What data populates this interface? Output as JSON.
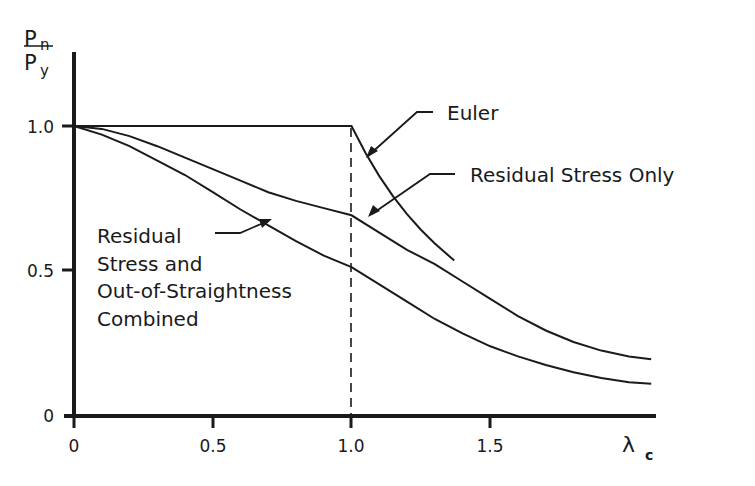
{
  "chart_data": {
    "type": "line",
    "title": "",
    "xlabel": "λ c",
    "xlabel_main": "λ",
    "xlabel_sub": "c",
    "ylabel": "Pn/Py",
    "ylabel_num_main": "P",
    "ylabel_num_sub": "n",
    "ylabel_den_main": "P",
    "ylabel_den_sub": "y",
    "xlim": [
      0,
      2.1
    ],
    "ylim": [
      0,
      1.15
    ],
    "grid": false,
    "x_ticks": [
      "0",
      "0.5",
      "1.0",
      "1.5"
    ],
    "x_tick_values": [
      0,
      0.5,
      1.0,
      1.5
    ],
    "y_ticks": [
      "0",
      "0.5",
      "1.0"
    ],
    "y_tick_values": [
      0,
      0.5,
      1.0
    ],
    "reference_line": {
      "x": 1.0,
      "style": "dashed",
      "from": 0,
      "to": 1.0
    },
    "series": [
      {
        "name": "Euler",
        "label": "Euler",
        "points": [
          [
            0,
            1.0
          ],
          [
            1.0,
            1.0
          ],
          [
            1.05,
            0.907
          ],
          [
            1.1,
            0.826
          ],
          [
            1.15,
            0.756
          ],
          [
            1.2,
            0.694
          ],
          [
            1.25,
            0.64
          ],
          [
            1.3,
            0.592
          ],
          [
            1.37,
            0.533
          ]
        ]
      },
      {
        "name": "Residual Stress Only",
        "label": "Residual Stress Only",
        "points": [
          [
            0,
            1.0
          ],
          [
            0.1,
            0.99
          ],
          [
            0.2,
            0.965
          ],
          [
            0.3,
            0.93
          ],
          [
            0.4,
            0.89
          ],
          [
            0.5,
            0.85
          ],
          [
            0.6,
            0.81
          ],
          [
            0.7,
            0.77
          ],
          [
            0.8,
            0.74
          ],
          [
            0.9,
            0.715
          ],
          [
            1.0,
            0.69
          ],
          [
            1.1,
            0.63
          ],
          [
            1.2,
            0.57
          ],
          [
            1.3,
            0.52
          ],
          [
            1.4,
            0.46
          ],
          [
            1.5,
            0.4
          ],
          [
            1.6,
            0.34
          ],
          [
            1.7,
            0.29
          ],
          [
            1.8,
            0.25
          ],
          [
            1.9,
            0.22
          ],
          [
            2.0,
            0.2
          ],
          [
            2.08,
            0.19
          ]
        ]
      },
      {
        "name": "Residual Stress and Out-of-Straightness Combined",
        "label_lines": [
          "Residual",
          "Stress and",
          "Out-of-Straightness",
          "Combined"
        ],
        "points": [
          [
            0,
            1.0
          ],
          [
            0.1,
            0.97
          ],
          [
            0.2,
            0.93
          ],
          [
            0.3,
            0.88
          ],
          [
            0.4,
            0.83
          ],
          [
            0.5,
            0.77
          ],
          [
            0.6,
            0.71
          ],
          [
            0.7,
            0.655
          ],
          [
            0.8,
            0.6
          ],
          [
            0.9,
            0.55
          ],
          [
            1.0,
            0.51
          ],
          [
            1.1,
            0.45
          ],
          [
            1.2,
            0.39
          ],
          [
            1.3,
            0.33
          ],
          [
            1.4,
            0.28
          ],
          [
            1.5,
            0.235
          ],
          [
            1.6,
            0.2
          ],
          [
            1.7,
            0.17
          ],
          [
            1.8,
            0.145
          ],
          [
            1.9,
            0.125
          ],
          [
            2.0,
            0.11
          ],
          [
            2.08,
            0.105
          ]
        ]
      }
    ]
  },
  "colors": {
    "ink": "#1a1a1a",
    "background": "#ffffff"
  }
}
